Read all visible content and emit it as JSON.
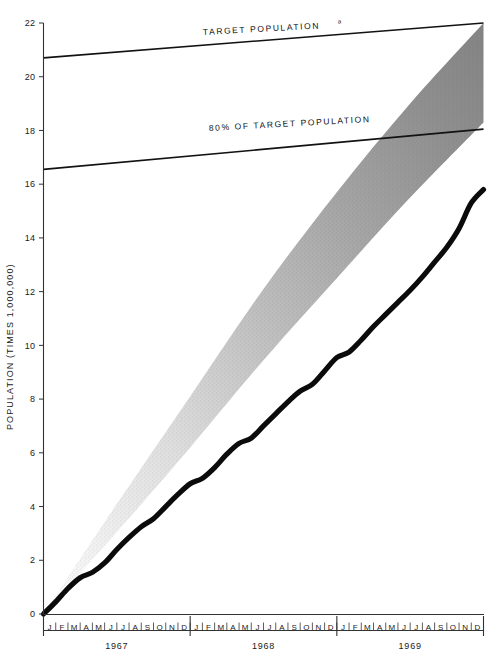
{
  "chart_data": {
    "type": "area",
    "title": "",
    "subtitle": "",
    "xlabel": "",
    "ylabel": "POPULATION (TIMES 1,000,000)",
    "ylim": [
      0,
      22
    ],
    "ytick_values": [
      0,
      2,
      4,
      6,
      8,
      10,
      12,
      14,
      16,
      18,
      20,
      22
    ],
    "ytick_labels": [
      "0",
      "2",
      "4",
      "6",
      "8",
      "10",
      "12",
      "14",
      "16",
      "18",
      "20",
      "22"
    ],
    "grid": false,
    "legend_position": "inline-annotations",
    "x_axis": {
      "type": "monthly",
      "month_letters": [
        "J",
        "F",
        "M",
        "A",
        "M",
        "J",
        "J",
        "A",
        "S",
        "O",
        "N",
        "D"
      ],
      "years": [
        "1967",
        "1968",
        "1969"
      ],
      "xlim_months": [
        0,
        36
      ],
      "tick_marks": "monthly"
    },
    "annotations": [
      {
        "id": "target-population",
        "text": "TARGET POPULATION",
        "superscript": "a",
        "x_month": 15.5,
        "y": 21.1
      },
      {
        "id": "eighty-percent-target",
        "text": "80% OF TARGET POPULATION",
        "superscript": "",
        "x_month": 16.0,
        "y": 17.55
      }
    ],
    "series": [
      {
        "name": "TARGET POPULATION",
        "type": "line",
        "color": "#121212",
        "style": "straight-solid",
        "points": [
          {
            "x_month": 0,
            "y": 20.7
          },
          {
            "x_month": 36,
            "y": 22.0
          }
        ]
      },
      {
        "name": "80% OF TARGET POPULATION",
        "type": "line",
        "color": "#121212",
        "style": "straight-solid",
        "points": [
          {
            "x_month": 0,
            "y": 16.55
          },
          {
            "x_month": 36,
            "y": 18.05
          }
        ]
      },
      {
        "name": "Projected range (shaded band)",
        "type": "band",
        "color": "#8d8d8d",
        "style": "stippled-gradient-light-to-dark",
        "upper_points": [
          {
            "x_month": 0,
            "y": 0.0
          },
          {
            "x_month": 6,
            "y": 4.1
          },
          {
            "x_month": 12,
            "y": 8.1
          },
          {
            "x_month": 18,
            "y": 12.1
          },
          {
            "x_month": 24,
            "y": 15.7
          },
          {
            "x_month": 30,
            "y": 19.0
          },
          {
            "x_month": 36,
            "y": 22.0
          }
        ],
        "lower_points": [
          {
            "x_month": 0,
            "y": 0.0
          },
          {
            "x_month": 6,
            "y": 3.05
          },
          {
            "x_month": 12,
            "y": 6.2
          },
          {
            "x_month": 18,
            "y": 9.45
          },
          {
            "x_month": 24,
            "y": 12.5
          },
          {
            "x_month": 30,
            "y": 15.5
          },
          {
            "x_month": 36,
            "y": 18.3
          }
        ]
      },
      {
        "name": "Actual population",
        "type": "line",
        "color": "#0b0b0b",
        "style": "thick-solid",
        "points": [
          {
            "x_month": 0.0,
            "y": 0.0
          },
          {
            "x_month": 1.0,
            "y": 0.45
          },
          {
            "x_month": 2.0,
            "y": 0.95
          },
          {
            "x_month": 3.0,
            "y": 1.35
          },
          {
            "x_month": 4.0,
            "y": 1.55
          },
          {
            "x_month": 5.0,
            "y": 1.9
          },
          {
            "x_month": 6.0,
            "y": 2.4
          },
          {
            "x_month": 7.0,
            "y": 2.85
          },
          {
            "x_month": 8.0,
            "y": 3.25
          },
          {
            "x_month": 9.0,
            "y": 3.55
          },
          {
            "x_month": 10.0,
            "y": 4.0
          },
          {
            "x_month": 11.0,
            "y": 4.45
          },
          {
            "x_month": 12.0,
            "y": 4.85
          },
          {
            "x_month": 13.0,
            "y": 5.05
          },
          {
            "x_month": 14.0,
            "y": 5.45
          },
          {
            "x_month": 15.0,
            "y": 5.95
          },
          {
            "x_month": 16.0,
            "y": 6.35
          },
          {
            "x_month": 17.0,
            "y": 6.55
          },
          {
            "x_month": 18.0,
            "y": 7.0
          },
          {
            "x_month": 19.0,
            "y": 7.45
          },
          {
            "x_month": 20.0,
            "y": 7.9
          },
          {
            "x_month": 21.0,
            "y": 8.3
          },
          {
            "x_month": 22.0,
            "y": 8.55
          },
          {
            "x_month": 23.0,
            "y": 9.05
          },
          {
            "x_month": 24.0,
            "y": 9.55
          },
          {
            "x_month": 25.0,
            "y": 9.75
          },
          {
            "x_month": 26.0,
            "y": 10.2
          },
          {
            "x_month": 27.0,
            "y": 10.7
          },
          {
            "x_month": 28.0,
            "y": 11.15
          },
          {
            "x_month": 29.0,
            "y": 11.6
          },
          {
            "x_month": 30.0,
            "y": 12.05
          },
          {
            "x_month": 31.0,
            "y": 12.55
          },
          {
            "x_month": 32.0,
            "y": 13.1
          },
          {
            "x_month": 33.0,
            "y": 13.65
          },
          {
            "x_month": 34.0,
            "y": 14.35
          },
          {
            "x_month": 35.0,
            "y": 15.3
          },
          {
            "x_month": 36.0,
            "y": 15.8
          }
        ]
      }
    ]
  },
  "axes": {
    "y_axis_title": "POPULATION (TIMES 1,000,000)",
    "y_ticks": [
      "22",
      "20",
      "18",
      "16",
      "14",
      "12",
      "10",
      "8",
      "6",
      "4",
      "2",
      "0"
    ]
  },
  "x_axis_strip": {
    "year_groups": [
      {
        "year": "1967",
        "months": [
          "J",
          "F",
          "M",
          "A",
          "M",
          "J",
          "J",
          "A",
          "S",
          "O",
          "N",
          "D"
        ]
      },
      {
        "year": "1968",
        "months": [
          "J",
          "F",
          "M",
          "A",
          "M",
          "J",
          "J",
          "A",
          "S",
          "O",
          "N",
          "D"
        ]
      },
      {
        "year": "1969",
        "months": [
          "J",
          "F",
          "M",
          "A",
          "M",
          "J",
          "J",
          "A",
          "S",
          "O",
          "N",
          "D"
        ]
      }
    ]
  },
  "annotations": {
    "target_population": "TARGET POPULATION",
    "target_population_superscript": "a",
    "eighty_percent": "80% OF TARGET POPULATION"
  },
  "colors": {
    "ink": "#121212",
    "band_light": "#e9e9e9",
    "band_dark": "#8a8a8a",
    "background": "#ffffff"
  }
}
